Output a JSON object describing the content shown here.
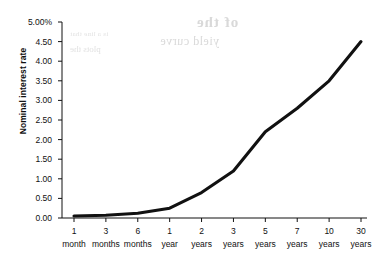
{
  "chart_data": {
    "type": "line",
    "title": "",
    "xlabel": "",
    "ylabel": "Nominal interest rate",
    "categories": [
      "1 month",
      "3 months",
      "6 months",
      "1 year",
      "2 years",
      "3 years",
      "5 years",
      "7 years",
      "10 years",
      "30 years"
    ],
    "category_parts": [
      {
        "num": "1",
        "unit": "month"
      },
      {
        "num": "3",
        "unit": "months"
      },
      {
        "num": "6",
        "unit": "months"
      },
      {
        "num": "1",
        "unit": "year"
      },
      {
        "num": "2",
        "unit": "years"
      },
      {
        "num": "3",
        "unit": "years"
      },
      {
        "num": "5",
        "unit": "years"
      },
      {
        "num": "7",
        "unit": "years"
      },
      {
        "num": "10",
        "unit": "years"
      },
      {
        "num": "30",
        "unit": "years"
      }
    ],
    "values": [
      0.05,
      0.07,
      0.12,
      0.25,
      0.65,
      1.2,
      2.2,
      2.8,
      3.5,
      4.5
    ],
    "series": [
      {
        "name": "Nominal interest rate",
        "values": [
          0.05,
          0.07,
          0.12,
          0.25,
          0.65,
          1.2,
          2.2,
          2.8,
          3.5,
          4.5
        ],
        "color": "#111111"
      }
    ],
    "ylim": [
      0.0,
      5.0
    ],
    "ytick_values": [
      0.0,
      0.5,
      1.0,
      1.5,
      2.0,
      2.5,
      3.0,
      3.5,
      4.0,
      4.5,
      5.0
    ],
    "ytick_labels": [
      "0.00",
      "0.50",
      "1.00",
      "1.50",
      "2.00",
      "2.50",
      "3.00",
      "3.50",
      "4.00",
      "4.50",
      "5.00%"
    ],
    "grid": false,
    "legend": false,
    "legend_position": "none"
  },
  "artifacts": {
    "note": "faint reverse-side print bleed-through visible behind the plot",
    "marks": [
      "of the",
      "yield curve",
      "is a line that",
      "plots the"
    ]
  },
  "colors": {
    "line": "#111111",
    "axis": "#111111",
    "background": "#ffffff",
    "bleed": "#d9d9d9"
  }
}
